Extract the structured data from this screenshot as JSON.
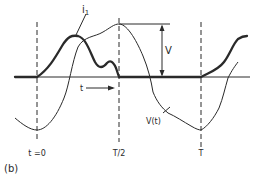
{
  "figure": {
    "panel_label": "(b)",
    "labels": {
      "current": "i",
      "current_sub": "1",
      "voltage": "V(t)",
      "amplitude": "V",
      "time_arrow": "t"
    },
    "ticks": [
      {
        "label": "t =0",
        "x": 37
      },
      {
        "label": "T/2",
        "x": 119
      },
      {
        "label": "T",
        "x": 201
      }
    ],
    "colors": {
      "ink": "#2a2a2a",
      "background": "#ffffff"
    }
  }
}
